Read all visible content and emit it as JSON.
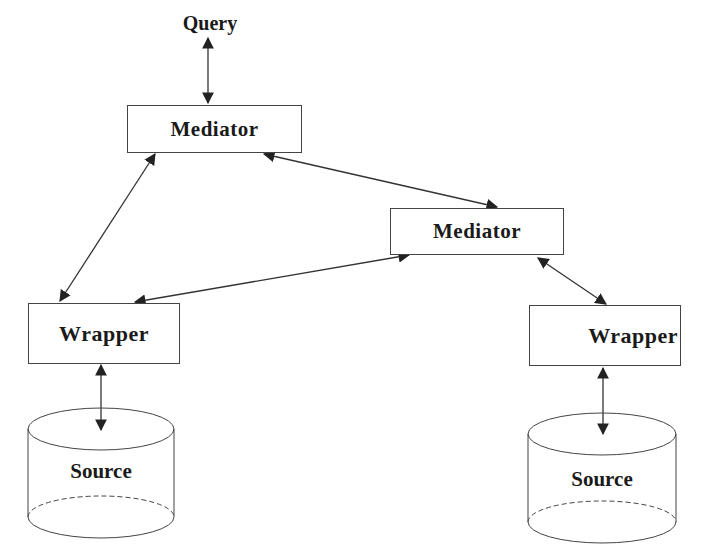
{
  "diagram": {
    "nodes": {
      "query": {
        "label": "Query"
      },
      "mediator_1": {
        "label": "Mediator"
      },
      "mediator_2": {
        "label": "Mediator"
      },
      "wrapper_left": {
        "label": "Wrapper"
      },
      "wrapper_right": {
        "label": "Wrapper"
      },
      "source_left": {
        "label": "Source"
      },
      "source_right": {
        "label": "Source"
      }
    },
    "edges": [
      {
        "from": "query",
        "to": "mediator_1",
        "bidirectional": true
      },
      {
        "from": "mediator_1",
        "to": "mediator_2",
        "bidirectional": true
      },
      {
        "from": "mediator_1",
        "to": "wrapper_left",
        "bidirectional": true
      },
      {
        "from": "mediator_2",
        "to": "wrapper_left",
        "bidirectional": true
      },
      {
        "from": "mediator_2",
        "to": "wrapper_right",
        "bidirectional": true
      },
      {
        "from": "wrapper_left",
        "to": "source_left",
        "bidirectional": true
      },
      {
        "from": "wrapper_right",
        "to": "source_right",
        "bidirectional": true
      }
    ],
    "colors": {
      "stroke": "#333333",
      "text": "#1a1a1a",
      "background": "#ffffff"
    }
  }
}
